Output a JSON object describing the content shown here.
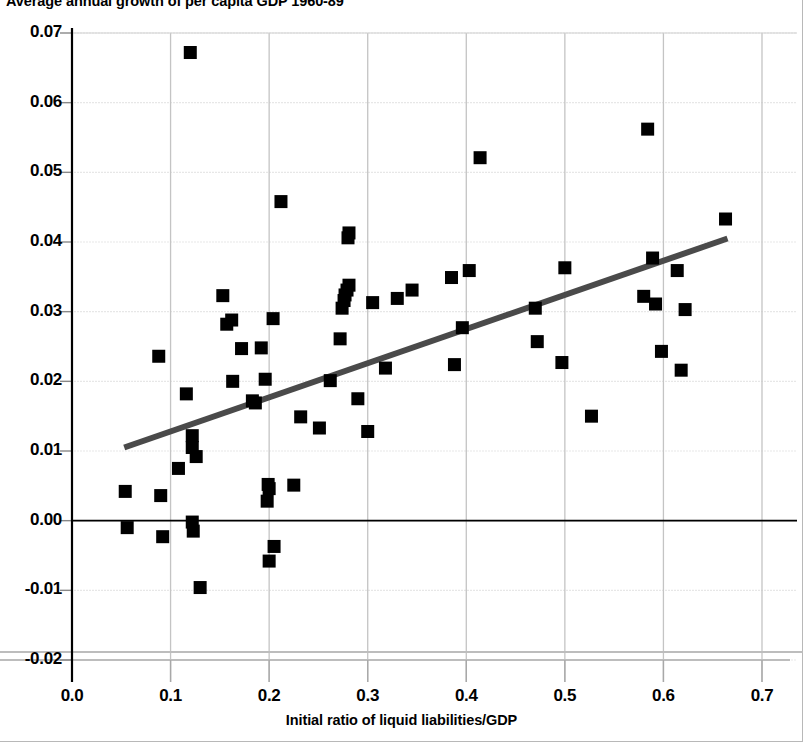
{
  "chart_data": {
    "type": "scatter",
    "title": "Average annual growth of per capita GDP  1960-89",
    "xlabel": "Initial ratio of liquid liabilities/GDP",
    "ylabel": "",
    "xlim": [
      -0.02,
      0.72
    ],
    "ylim": [
      -0.02,
      0.07
    ],
    "xticks": [
      "0.0",
      "0.1",
      "0.2",
      "0.3",
      "0.4",
      "0.5",
      "0.6",
      "0.7"
    ],
    "xtick_values": [
      0.0,
      0.1,
      0.2,
      0.3,
      0.4,
      0.5,
      0.6,
      0.7
    ],
    "yticks": [
      "-0.02",
      "-0.01",
      "0.00",
      "0.01",
      "0.02",
      "0.03",
      "0.04",
      "0.05",
      "0.06",
      "0.07"
    ],
    "ytick_values": [
      -0.02,
      -0.01,
      0.0,
      0.01,
      0.02,
      0.03,
      0.04,
      0.05,
      0.06,
      0.07
    ],
    "grid": true,
    "legend": "none",
    "marker": "square",
    "marker_color": "#000000",
    "marker_size": 13,
    "series": [
      {
        "name": "Countries",
        "points": [
          [
            0.054,
            0.0042
          ],
          [
            0.056,
            -0.001
          ],
          [
            0.088,
            0.0236
          ],
          [
            0.09,
            0.0036
          ],
          [
            0.092,
            -0.0023
          ],
          [
            0.108,
            0.0075
          ],
          [
            0.116,
            0.0182
          ],
          [
            0.12,
            0.0672
          ],
          [
            0.122,
            0.0122
          ],
          [
            0.122,
            0.0105
          ],
          [
            0.122,
            -0.0002
          ],
          [
            0.123,
            -0.0015
          ],
          [
            0.126,
            0.0092
          ],
          [
            0.13,
            -0.0096
          ],
          [
            0.153,
            0.0323
          ],
          [
            0.157,
            0.0282
          ],
          [
            0.162,
            0.0288
          ],
          [
            0.163,
            0.02
          ],
          [
            0.172,
            0.0247
          ],
          [
            0.183,
            0.0172
          ],
          [
            0.186,
            0.0169
          ],
          [
            0.192,
            0.0248
          ],
          [
            0.196,
            0.0203
          ],
          [
            0.198,
            0.0028
          ],
          [
            0.199,
            0.0052
          ],
          [
            0.2,
            0.0046
          ],
          [
            0.2,
            -0.0058
          ],
          [
            0.204,
            0.029
          ],
          [
            0.205,
            -0.0037
          ],
          [
            0.212,
            0.0458
          ],
          [
            0.225,
            0.0051
          ],
          [
            0.232,
            0.0149
          ],
          [
            0.251,
            0.0133
          ],
          [
            0.262,
            0.0201
          ],
          [
            0.272,
            0.0261
          ],
          [
            0.274,
            0.0305
          ],
          [
            0.276,
            0.0316
          ],
          [
            0.277,
            0.0324
          ],
          [
            0.279,
            0.0331
          ],
          [
            0.28,
            0.0406
          ],
          [
            0.281,
            0.0413
          ],
          [
            0.281,
            0.0338
          ],
          [
            0.29,
            0.0175
          ],
          [
            0.3,
            0.0128
          ],
          [
            0.305,
            0.0313
          ],
          [
            0.318,
            0.0219
          ],
          [
            0.33,
            0.0319
          ],
          [
            0.345,
            0.0331
          ],
          [
            0.385,
            0.0349
          ],
          [
            0.388,
            0.0224
          ],
          [
            0.396,
            0.0277
          ],
          [
            0.403,
            0.0359
          ],
          [
            0.414,
            0.0521
          ],
          [
            0.47,
            0.0305
          ],
          [
            0.472,
            0.0257
          ],
          [
            0.497,
            0.0227
          ],
          [
            0.5,
            0.0363
          ],
          [
            0.527,
            0.015
          ],
          [
            0.58,
            0.0322
          ],
          [
            0.584,
            0.0562
          ],
          [
            0.589,
            0.0377
          ],
          [
            0.592,
            0.0311
          ],
          [
            0.598,
            0.0243
          ],
          [
            0.614,
            0.0359
          ],
          [
            0.618,
            0.0216
          ],
          [
            0.622,
            0.0303
          ],
          [
            0.663,
            0.0433
          ]
        ]
      }
    ],
    "trendline": {
      "name": "fitted-regression-line",
      "color": "#4a4a4a",
      "width": 6,
      "x0": 0.053,
      "y0": 0.0105,
      "x1": 0.665,
      "y1": 0.0405
    },
    "zero_line": {
      "name": "zero-baseline",
      "value": 0.0,
      "color": "#000000"
    }
  }
}
